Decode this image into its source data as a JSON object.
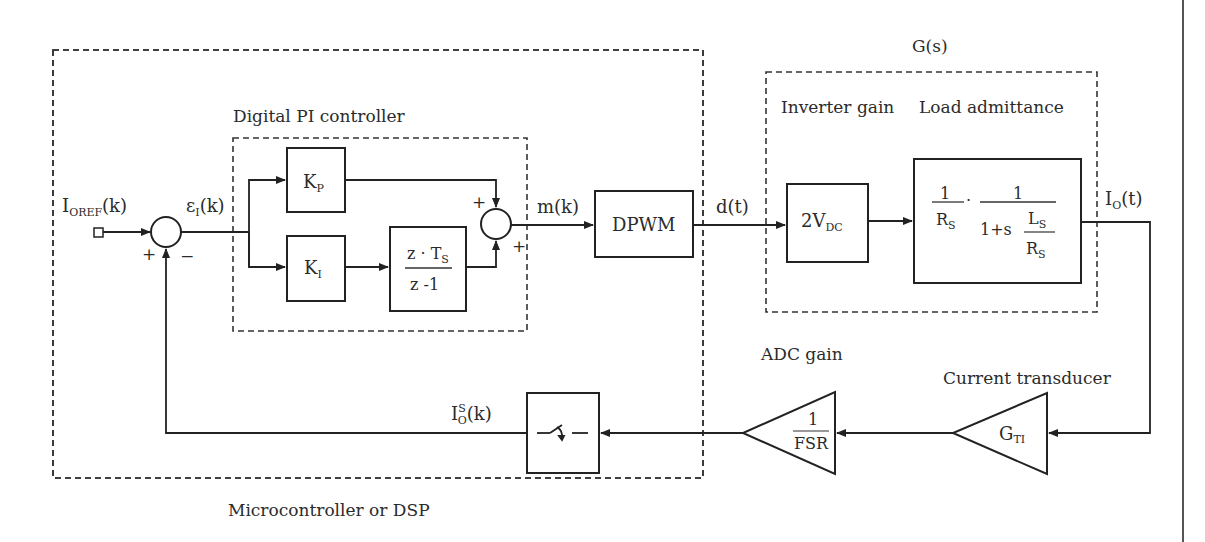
{
  "diagram": {
    "title_region_labels": {
      "microcontroller": "Microcontroller or DSP",
      "pi_controller": "Digital PI controller",
      "plant": "G(s)",
      "inverter_gain": "Inverter gain",
      "load_admittance": "Load admittance",
      "adc_gain": "ADC gain",
      "current_transducer": "Current transducer"
    },
    "signals": {
      "reference": {
        "main": "I",
        "sub": "OREF",
        "arg": "(k)"
      },
      "error": {
        "main": "ε",
        "sub": "I",
        "arg": "(k)"
      },
      "modulation": "m(k)",
      "duty": "d(t)",
      "output_current": {
        "main": "I",
        "sub": "O",
        "arg": "(t)"
      },
      "sampled_current": {
        "main": "I",
        "sup": "S",
        "sub": "O",
        "arg": "(k)"
      }
    },
    "blocks": {
      "kp": {
        "main": "K",
        "sub": "P"
      },
      "ki": {
        "main": "K",
        "sub": "I"
      },
      "integrator": {
        "num_main": "z · T",
        "num_sub": "S",
        "den": "z -1"
      },
      "dpwm": "DPWM",
      "inverter": {
        "main": "2V",
        "sub": "DC"
      },
      "load": {
        "f1_num": "1",
        "f1_den_main": "R",
        "f1_den_sub": "S",
        "dot": "·",
        "f2_num": "1",
        "f2_den_prefix": "1+s",
        "f2_inner_num_main": "L",
        "f2_inner_num_sub": "S",
        "f2_inner_den_main": "R",
        "f2_inner_den_sub": "S"
      },
      "adc": {
        "num": "1",
        "den": "FSR"
      },
      "transducer": {
        "main": "G",
        "sub": "TI"
      },
      "sampler": "sample-switch"
    },
    "sum_signs": {
      "sum1_left": "+",
      "sum1_right": "−",
      "sum2_top": "+",
      "sum2_bottom": "+"
    },
    "colors": {
      "controller_bg": "#e9e9e9",
      "line": "#222222",
      "page": "#ffffff"
    }
  }
}
